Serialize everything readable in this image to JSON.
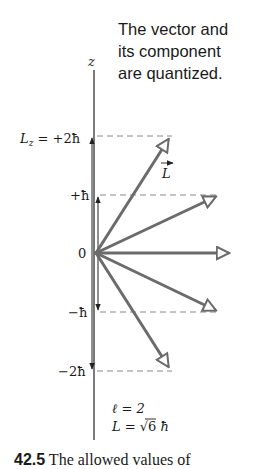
{
  "title": {
    "lines": [
      "The vector and",
      "its component",
      "are quantized."
    ]
  },
  "axis": {
    "label": "z"
  },
  "levels": [
    {
      "label": "L_z = +2ħ",
      "text_prefix": "L",
      "sub": "z",
      "text_suffix": " = +2ħ",
      "m": 2
    },
    {
      "label": "+ħ",
      "m": 1
    },
    {
      "label": "0",
      "m": 0
    },
    {
      "label": "−ħ",
      "m": -1
    },
    {
      "label": "−2ħ",
      "m": -2
    }
  ],
  "vector_label": "L",
  "params": {
    "l_line": "ℓ = 2",
    "L_prefix": "L = ",
    "L_sqrt": "√6",
    "L_suffix": " ħ"
  },
  "caption": {
    "number": "42.5",
    "text": " The allowed values of"
  },
  "colors": {
    "vector": "#6b6b6b",
    "axis": "#333333",
    "dash": "#888888",
    "text": "#1a1a1a"
  }
}
